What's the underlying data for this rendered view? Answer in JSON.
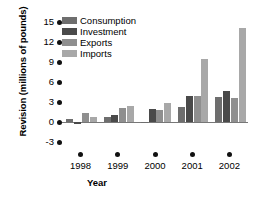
{
  "chart_data": {
    "type": "bar",
    "title": "",
    "xlabel": "Year",
    "ylabel": "Revision (millions of pounds)",
    "categories": [
      "1998",
      "1999",
      "2000",
      "2001",
      "2002"
    ],
    "ylim": [
      -3,
      15
    ],
    "yticks": [
      "15",
      "12",
      "9",
      "6",
      "3",
      "0",
      "-3"
    ],
    "ytick_values": [
      15,
      12,
      9,
      6,
      3,
      0,
      -3
    ],
    "grid": false,
    "legend_position": "top-left",
    "series": [
      {
        "name": "Consumption",
        "color": "#6e6e6e",
        "values": [
          0.4,
          0.7,
          -0.1,
          2.2,
          3.7
        ]
      },
      {
        "name": "Investment",
        "color": "#4a4a4a",
        "values": [
          -0.3,
          1.1,
          1.9,
          3.9,
          4.6
        ]
      },
      {
        "name": "Exports",
        "color": "#8f8f8f",
        "values": [
          1.4,
          2.1,
          1.8,
          3.9,
          3.6
        ]
      },
      {
        "name": "Imports",
        "color": "#a8a8a8",
        "values": [
          0.8,
          2.4,
          2.9,
          9.5,
          14.1
        ]
      }
    ]
  }
}
